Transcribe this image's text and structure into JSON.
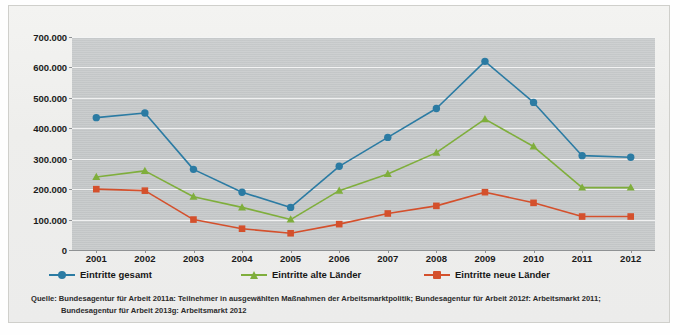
{
  "chart_data": {
    "type": "line",
    "title": "",
    "xlabel": "",
    "ylabel": "",
    "x": [
      "2001",
      "2002",
      "2003",
      "2004",
      "2005",
      "2006",
      "2007",
      "2008",
      "2009",
      "2010",
      "2011",
      "2012"
    ],
    "categories": [
      "2001",
      "2002",
      "2003",
      "2004",
      "2005",
      "2006",
      "2007",
      "2008",
      "2009",
      "2010",
      "2011",
      "2012"
    ],
    "ylim": [
      0,
      700000
    ],
    "ytick_values": [
      0,
      100000,
      200000,
      300000,
      400000,
      500000,
      600000,
      700000
    ],
    "ytick_labels": [
      "0",
      "100.000",
      "200.000",
      "300.000",
      "400.000",
      "500.000",
      "600.000",
      "700.000"
    ],
    "grid": true,
    "legend_position": "bottom",
    "series": [
      {
        "name": "Eintritte gesamt",
        "color": "#2b7ba3",
        "marker": "circle",
        "values": [
          435000,
          450000,
          265000,
          190000,
          140000,
          275000,
          370000,
          465000,
          620000,
          485000,
          310000,
          305000
        ]
      },
      {
        "name": "Eintritte alte Länder",
        "color": "#7fae3c",
        "marker": "triangle",
        "values": [
          240000,
          260000,
          175000,
          140000,
          100000,
          195000,
          250000,
          320000,
          430000,
          340000,
          205000,
          205000
        ]
      },
      {
        "name": "Eintritte neue Länder",
        "color": "#d4502c",
        "marker": "square",
        "values": [
          200000,
          195000,
          100000,
          70000,
          55000,
          85000,
          120000,
          145000,
          190000,
          155000,
          110000,
          110000
        ]
      }
    ]
  },
  "legend": {
    "items": [
      {
        "label": "Eintritte gesamt"
      },
      {
        "label": "Eintritte alte Länder"
      },
      {
        "label": "Eintritte neue Länder"
      }
    ]
  },
  "source": {
    "line1": "Quelle: Bundesagentur für Arbeit 2011a: Teilnehmer in ausgewählten Maßnahmen der Arbeitsmarktpolitik; Bundesagentur für Arbeit 2012f: Arbeitsmarkt 2011;",
    "line2": "Bundesagentur für Arbeit 2013g: Arbeitsmarkt 2012"
  },
  "colors": {
    "series_blue": "#2b7ba3",
    "series_green": "#7fae3c",
    "series_red": "#d4502c",
    "plot_background": "#c5c8c9",
    "panel_background": "#efefed",
    "gridline": "#ffffff"
  }
}
